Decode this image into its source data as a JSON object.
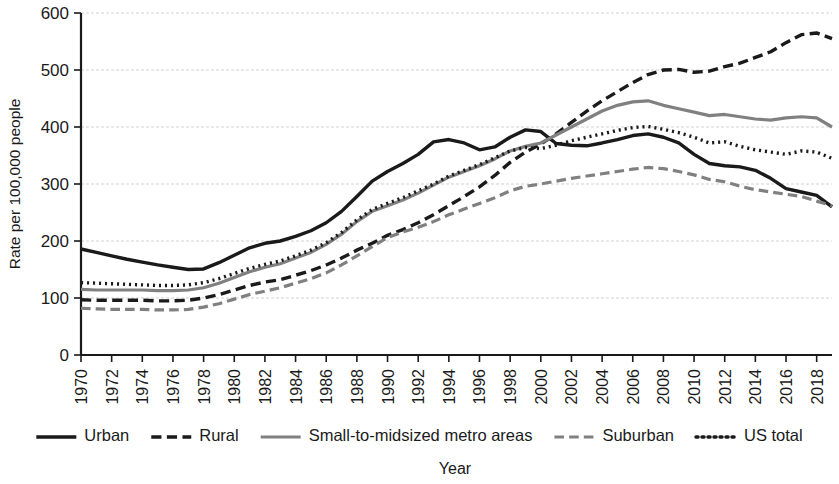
{
  "chart_data": {
    "type": "line",
    "title": "",
    "xlabel": "Year",
    "ylabel": "Rate per 100,000 people",
    "xlim": [
      1970,
      2019
    ],
    "ylim": [
      0,
      600
    ],
    "yticks": [
      0,
      100,
      200,
      300,
      400,
      500,
      600
    ],
    "grid": true,
    "legend_position": "bottom",
    "x": [
      1970,
      1971,
      1972,
      1973,
      1974,
      1975,
      1976,
      1977,
      1978,
      1979,
      1980,
      1981,
      1982,
      1983,
      1984,
      1985,
      1986,
      1987,
      1988,
      1989,
      1990,
      1991,
      1992,
      1993,
      1994,
      1995,
      1996,
      1997,
      1998,
      1999,
      2000,
      2001,
      2002,
      2003,
      2004,
      2005,
      2006,
      2007,
      2008,
      2009,
      2010,
      2011,
      2012,
      2013,
      2014,
      2015,
      2016,
      2017,
      2018,
      2019
    ],
    "xticks": [
      1970,
      1972,
      1974,
      1976,
      1978,
      1980,
      1982,
      1984,
      1986,
      1988,
      1990,
      1992,
      1994,
      1996,
      1998,
      2000,
      2002,
      2004,
      2006,
      2008,
      2010,
      2012,
      2014,
      2016,
      2018
    ],
    "xticklabels": [
      "1970",
      "1972",
      "1974",
      "1976",
      "1978",
      "1980",
      "1982",
      "1984",
      "1986",
      "1988",
      "1990",
      "1992",
      "1994",
      "1996",
      "1998",
      "2000",
      "2002",
      "2004",
      "2006",
      "2008",
      "2010",
      "2012",
      "2014",
      "2016",
      "2018"
    ],
    "series": [
      {
        "name": "Urban",
        "style": "solid",
        "color": "#1a1a1a",
        "width": 3.4,
        "values": [
          186,
          180,
          174,
          168,
          163,
          158,
          154,
          150,
          151,
          162,
          175,
          188,
          196,
          200,
          208,
          218,
          232,
          252,
          278,
          305,
          322,
          336,
          352,
          374,
          378,
          372,
          360,
          365,
          382,
          395,
          392,
          371,
          368,
          367,
          372,
          378,
          385,
          388,
          382,
          372,
          352,
          336,
          332,
          330,
          324,
          310,
          292,
          286,
          280,
          260
        ]
      },
      {
        "name": "Rural",
        "style": "dashed",
        "color": "#1a1a1a",
        "width": 3.4,
        "values": [
          97,
          96,
          96,
          96,
          96,
          95,
          95,
          96,
          100,
          106,
          114,
          122,
          128,
          132,
          140,
          148,
          158,
          170,
          184,
          196,
          210,
          220,
          232,
          246,
          262,
          278,
          295,
          315,
          338,
          356,
          370,
          388,
          408,
          428,
          446,
          462,
          478,
          492,
          500,
          501,
          496,
          498,
          506,
          512,
          522,
          532,
          548,
          562,
          565,
          555
        ]
      },
      {
        "name": "Small-to-midsized metro areas",
        "style": "solid",
        "color": "#808080",
        "width": 3.2,
        "values": [
          115,
          114,
          114,
          114,
          114,
          113,
          113,
          114,
          118,
          126,
          136,
          146,
          154,
          160,
          170,
          180,
          194,
          212,
          234,
          252,
          262,
          272,
          284,
          298,
          312,
          322,
          332,
          344,
          358,
          366,
          372,
          386,
          400,
          414,
          428,
          438,
          444,
          446,
          438,
          432,
          426,
          420,
          422,
          418,
          414,
          412,
          416,
          418,
          416,
          400
        ]
      },
      {
        "name": "Suburban",
        "style": "dashed",
        "color": "#808080",
        "width": 3.2,
        "values": [
          82,
          81,
          80,
          80,
          80,
          79,
          79,
          80,
          84,
          90,
          98,
          106,
          112,
          118,
          126,
          134,
          144,
          158,
          174,
          190,
          206,
          216,
          224,
          234,
          246,
          256,
          266,
          276,
          288,
          296,
          300,
          305,
          310,
          314,
          318,
          322,
          326,
          329,
          327,
          322,
          316,
          308,
          304,
          296,
          290,
          286,
          282,
          278,
          270,
          262
        ]
      },
      {
        "name": "US total",
        "style": "dotted",
        "color": "#1a1a1a",
        "width": 3.4,
        "values": [
          127,
          126,
          125,
          124,
          123,
          122,
          122,
          123,
          127,
          134,
          143,
          152,
          159,
          165,
          174,
          184,
          197,
          215,
          237,
          255,
          266,
          276,
          288,
          300,
          314,
          324,
          334,
          346,
          358,
          364,
          362,
          368,
          376,
          382,
          388,
          394,
          399,
          401,
          396,
          390,
          382,
          372,
          374,
          366,
          360,
          356,
          352,
          358,
          356,
          345
        ]
      }
    ]
  },
  "legend": {
    "items": [
      {
        "label": "Urban"
      },
      {
        "label": "Rural"
      },
      {
        "label": "Small-to-midsized metro areas"
      },
      {
        "label": "Suburban"
      },
      {
        "label": "US total"
      }
    ]
  }
}
